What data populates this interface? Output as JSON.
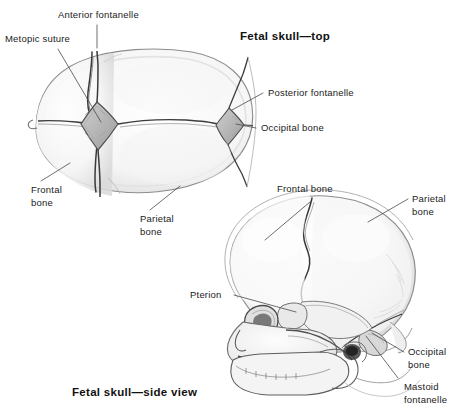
{
  "figure": {
    "kind": "anatomical-illustration",
    "subject": "Fetal skull",
    "background_color": "#ffffff",
    "label_color": "#1b1b1b",
    "title_color": "#111111",
    "leader_line_color": "#4a4a4a",
    "bone_fill_color": "#f2f2f2",
    "bone_outline_color": "#8a8a8a",
    "suture_color": "#2b2b2b"
  },
  "titles": {
    "top_view": "Fetal skull—top",
    "side_view": "Fetal skull—side view"
  },
  "top_view_labels": {
    "anterior_fontanelle": "Anterior fontanelle",
    "metopic_suture": "Metopic suture",
    "posterior_fontanelle": "Posterior fontanelle",
    "occipital_bone": "Occipital bone",
    "frontal_bone": "Frontal\nbone",
    "parietal_bone": "Parietal\nbone"
  },
  "side_view_labels": {
    "frontal_bone": "Frontal bone",
    "parietal_bone": "Parietal\nbone",
    "pterion": "Pterion",
    "occipital_bone": "Occipital\nbone",
    "mastoid_fontanelle": "Mastoid\nfontanelle"
  }
}
